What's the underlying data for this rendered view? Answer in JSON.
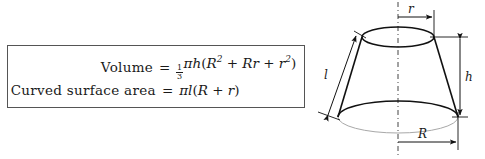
{
  "formula_box": {
    "rows": [
      {
        "label": "Volume",
        "equals": "=",
        "expression_plain": "1/3 πh(R² + Rr + r²)",
        "fraction_numerator": "1",
        "fraction_denominator": "3",
        "pi": "π",
        "var_h": "h",
        "open_paren": "(",
        "var_R": "R",
        "exp_2a": "2",
        "plus_1": "+",
        "var_R2": "R",
        "var_r1": "r",
        "plus_2": "+",
        "var_r2": "r",
        "exp_2b": "2",
        "close_paren": ")"
      },
      {
        "label": "Curved surface area",
        "equals": "=",
        "expression_plain": "πl(R + r)",
        "pi": "π",
        "var_l": "l",
        "open_paren": "(",
        "var_R": "R",
        "plus": "+",
        "var_r": "r",
        "close_paren": ")"
      }
    ],
    "border_color": "#555555",
    "background": "#ffffff"
  },
  "diagram": {
    "shape": "frustum-of-a-cone",
    "labels": {
      "top_radius": "r",
      "bottom_radius": "R",
      "height": "h",
      "slant_height": "l"
    },
    "axis_style": "dash-dot vertical centerline",
    "stroke_color": "#111111",
    "hidden_line_color": "#9a9a9a"
  }
}
